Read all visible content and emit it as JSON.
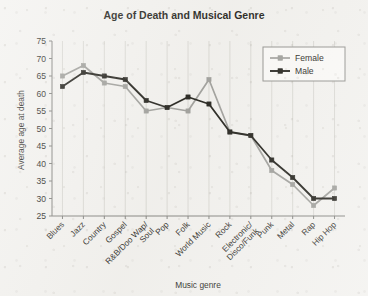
{
  "chart_data": {
    "type": "line",
    "title": "Age of Death and Musical Genre",
    "xlabel": "Music genre",
    "ylabel": "Average age at death",
    "categories": [
      "Blues",
      "Jazz",
      "Country",
      "Gospel",
      "R&B/Doo Wap/\nSoul",
      "Pop",
      "Folk",
      "World Music",
      "Rock",
      "Electronic/\nDisco/Funk",
      "Punk",
      "Metal",
      "Rap",
      "Hip Hop"
    ],
    "yticks": [
      25,
      30,
      35,
      40,
      45,
      50,
      55,
      60,
      65,
      70,
      75
    ],
    "ylim": [
      25,
      75
    ],
    "grid": "vertical",
    "legend_position": "top-right",
    "series": [
      {
        "name": "Female",
        "color": "#9a9a96",
        "values": [
          65,
          68,
          63,
          62,
          55,
          56,
          55,
          64,
          49,
          48,
          38,
          34,
          28,
          33
        ]
      },
      {
        "name": "Male",
        "color": "#16150f",
        "values": [
          62,
          66,
          65,
          64,
          58,
          56,
          59,
          57,
          49,
          48,
          41,
          36,
          30,
          30
        ]
      }
    ]
  },
  "legend": {
    "entries": [
      {
        "label": "Female"
      },
      {
        "label": "Male"
      }
    ]
  },
  "colors": {
    "background": "#f2f1ee",
    "axis": "#7d7d79",
    "grid": "#d8d7d2",
    "female": "#9a9a96",
    "male": "#16150f",
    "text": "#1d1c17"
  }
}
